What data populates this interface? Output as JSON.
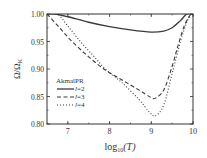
{
  "chart_data": {
    "type": "line",
    "title": "",
    "xlabel": "log10(T)",
    "xlabel_main": "log",
    "xlabel_sub": "10",
    "xlabel_arg": "(T)",
    "ylabel": "Ω/Ω_K",
    "ylabel_main": "Ω/Ω",
    "ylabel_sub": "K",
    "xlim": [
      6.5,
      10
    ],
    "ylim": [
      0.8,
      1.0
    ],
    "xticks": [
      7,
      8,
      9,
      10
    ],
    "xtick_labels": [
      "7",
      "8",
      "9",
      "10"
    ],
    "yticks": [
      0.8,
      0.85,
      0.9,
      0.95,
      1.0
    ],
    "ytick_labels": [
      "0.80",
      "0.85",
      "0.90",
      "0.95",
      "1.00"
    ],
    "grid": false,
    "legend": {
      "title": "AkmalPR",
      "position": "center-left",
      "entries": [
        "l=2",
        "l=3",
        "l=4"
      ]
    },
    "series": [
      {
        "name": "l=2",
        "style": "solid",
        "x": [
          6.5,
          6.7,
          7.0,
          7.5,
          8.0,
          8.5,
          9.0,
          9.3,
          9.5,
          9.7,
          9.85,
          10.0
        ],
        "y": [
          1.0,
          1.0,
          0.995,
          0.985,
          0.977,
          0.971,
          0.967,
          0.969,
          0.975,
          0.988,
          1.0,
          1.0
        ]
      },
      {
        "name": "l=3",
        "style": "dashed",
        "x": [
          6.5,
          6.8,
          7.1,
          7.5,
          7.9,
          8.3,
          8.7,
          9.0,
          9.1,
          9.3,
          9.5,
          9.65,
          9.8,
          9.95
        ],
        "y": [
          1.0,
          0.975,
          0.95,
          0.922,
          0.898,
          0.88,
          0.862,
          0.848,
          0.847,
          0.862,
          0.905,
          0.945,
          0.98,
          1.0
        ]
      },
      {
        "name": "l=4",
        "style": "dotted",
        "x": [
          6.5,
          6.75,
          7.0,
          7.3,
          7.6,
          7.9,
          8.3,
          8.7,
          8.95,
          9.1,
          9.3,
          9.5,
          9.7,
          9.85,
          9.95
        ],
        "y": [
          1.0,
          1.0,
          0.978,
          0.95,
          0.925,
          0.9,
          0.875,
          0.845,
          0.822,
          0.815,
          0.835,
          0.892,
          0.95,
          0.985,
          1.0
        ]
      }
    ]
  }
}
